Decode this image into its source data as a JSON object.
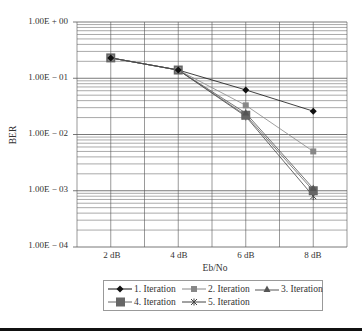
{
  "chart_data": {
    "type": "line",
    "title": "",
    "xlabel": "Eb/No",
    "ylabel": "BER",
    "yscale": "log",
    "ylim": [
      0.0001,
      1
    ],
    "categories": [
      "2 dB",
      "4 dB",
      "6 dB",
      "8 dB"
    ],
    "ytick_labels": [
      "1.00E + 00",
      "1.00E − 01",
      "1.00E − 02",
      "1.00E − 03",
      "1.00E − 04"
    ],
    "grid": true,
    "legend_position": "bottom",
    "series": [
      {
        "name": "1. Iteration",
        "marker": "diamond",
        "values": [
          0.23,
          0.14,
          0.062,
          0.026
        ]
      },
      {
        "name": "2. Iteration",
        "marker": "square-small",
        "values": [
          0.23,
          0.14,
          0.033,
          0.005
        ]
      },
      {
        "name": "3. Iteration",
        "marker": "triangle",
        "values": [
          0.23,
          0.14,
          0.024,
          0.0011
        ]
      },
      {
        "name": "4. Iteration",
        "marker": "square-large",
        "values": [
          0.23,
          0.14,
          0.022,
          0.001
        ]
      },
      {
        "name": "5. Iteration",
        "marker": "star",
        "values": [
          0.23,
          0.14,
          0.021,
          0.0008
        ]
      }
    ]
  },
  "legend": {
    "items": [
      "1. Iteration",
      "2. Iteration",
      "3. Iteration",
      "4. Iteration",
      "5. Iteration"
    ]
  },
  "colors": {
    "series1": "#111111",
    "series2": "#888888",
    "series3": "#555555",
    "series4": "#666666",
    "series5": "#444444",
    "grid": "#555555"
  }
}
